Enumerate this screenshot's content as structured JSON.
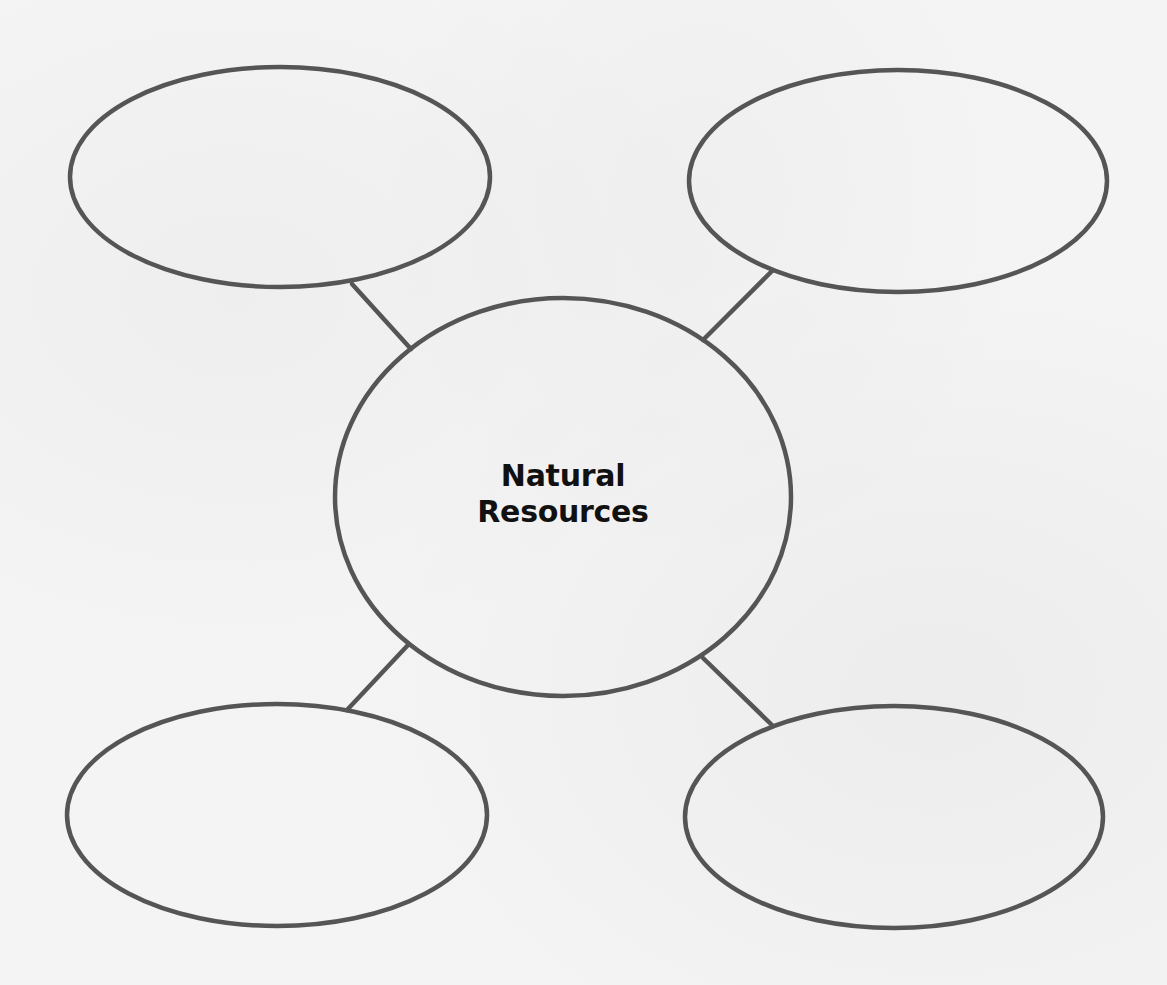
{
  "diagram": {
    "type": "word-web",
    "center": {
      "line1": "Natural",
      "line2": "Resources"
    },
    "outer_bubbles": [
      {
        "position": "top-left",
        "text": ""
      },
      {
        "position": "top-right",
        "text": ""
      },
      {
        "position": "bottom-left",
        "text": ""
      },
      {
        "position": "bottom-right",
        "text": ""
      }
    ],
    "colors": {
      "background": "#f4f4f4",
      "stroke": "#555555",
      "text": "#111111"
    }
  }
}
